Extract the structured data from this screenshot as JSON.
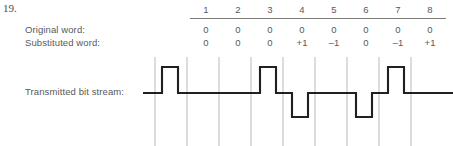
{
  "figure": {
    "problem_number": "19.",
    "labels": {
      "original_word": "Original word:",
      "substituted_word": "Substituted word:",
      "transmitted_bit_stream": "Transmitted bit stream:"
    },
    "columns": [
      "1",
      "2",
      "3",
      "4",
      "5",
      "6",
      "7",
      "8"
    ],
    "rows": {
      "original_word": [
        "0",
        "0",
        "0",
        "0",
        "0",
        "0",
        "0",
        "0"
      ],
      "substituted_word": [
        "0",
        "0",
        "0",
        "+1",
        "–1",
        "0",
        "–1",
        "+1"
      ]
    },
    "colors": {
      "text": "#58595b",
      "rule": "#7a7a7a",
      "gridline": "#b9b9bd",
      "waveform": "#231f20"
    }
  },
  "chart_data": {
    "type": "line",
    "title": "Transmitted bit stream",
    "xlabel": "",
    "ylabel": "",
    "categories": [
      "1",
      "2",
      "3",
      "4",
      "5",
      "6",
      "7",
      "8"
    ],
    "series": [
      {
        "name": "Original word",
        "values": [
          0,
          0,
          0,
          0,
          0,
          0,
          0,
          0
        ]
      },
      {
        "name": "Substituted word",
        "values": [
          0,
          0,
          0,
          1,
          -1,
          0,
          -1,
          1
        ]
      },
      {
        "name": "Transmitted bit stream",
        "values": [
          0,
          0,
          0,
          1,
          -1,
          0,
          -1,
          1
        ]
      }
    ],
    "ylim": [
      -1,
      1
    ],
    "grid": true,
    "legend": "none",
    "waveform_levels": {
      "high": 1,
      "baseline": 0,
      "low": -1
    },
    "pulse_positions": {
      "positive": [
        4,
        8
      ],
      "negative": [
        5,
        7
      ],
      "lead_in_positive": true
    }
  }
}
